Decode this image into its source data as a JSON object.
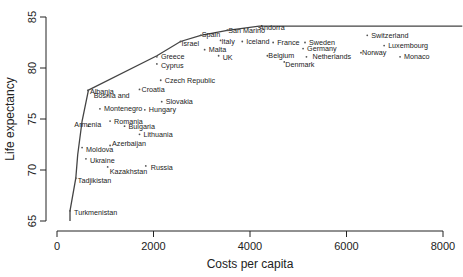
{
  "chart_data": {
    "type": "scatter",
    "title": "",
    "xlabel": "Costs per capita",
    "ylabel": "Life expectancy",
    "xlim": [
      0,
      8400
    ],
    "ylim": [
      65,
      85
    ],
    "x_ticks": [
      0,
      2000,
      4000,
      6000,
      8000
    ],
    "y_ticks": [
      65,
      70,
      75,
      80,
      85
    ],
    "x_tick_labels": [
      "0",
      "2000",
      "4000",
      "6000",
      "8000"
    ],
    "y_tick_labels": [
      "65",
      "70",
      "75",
      "80",
      "85"
    ],
    "grid": false,
    "legend": null,
    "points": [
      {
        "label": "Turkmenistan",
        "x": 270,
        "y": 66.0,
        "dx": 4,
        "dy": 2
      },
      {
        "label": "Tadjikistan",
        "x": 390,
        "y": 69.2,
        "dx": 2,
        "dy": 2
      },
      {
        "label": "Moldova",
        "x": 520,
        "y": 72.2,
        "dx": 4,
        "dy": 2
      },
      {
        "label": "Ukraine",
        "x": 600,
        "y": 71.1,
        "dx": 4,
        "dy": 2
      },
      {
        "label": "Kazakhstan",
        "x": 1050,
        "y": 70.3,
        "dx": 2,
        "dy": 5
      },
      {
        "label": "Russia",
        "x": 1840,
        "y": 70.4,
        "dx": 5,
        "dy": 2
      },
      {
        "label": "Azerbaijan",
        "x": 1100,
        "y": 72.4,
        "dx": 2,
        "dy": -2
      },
      {
        "label": "Armenia",
        "x": 650,
        "y": 74.3,
        "dx": -14,
        "dy": -2
      },
      {
        "label": "Romania",
        "x": 1100,
        "y": 74.8,
        "dx": 4,
        "dy": 0
      },
      {
        "label": "Bulgaria",
        "x": 1400,
        "y": 74.3,
        "dx": 4,
        "dy": 0
      },
      {
        "label": "Lithuania",
        "x": 1710,
        "y": 73.5,
        "dx": 4,
        "dy": 0
      },
      {
        "label": "Montenegro",
        "x": 890,
        "y": 76.0,
        "dx": 4,
        "dy": 0
      },
      {
        "label": "Hungary",
        "x": 1820,
        "y": 75.9,
        "dx": 4,
        "dy": 0
      },
      {
        "label": "Bosnia and",
        "x": 1050,
        "y": 77.3,
        "dx": -14,
        "dy": 0
      },
      {
        "label": "Albania",
        "x": 640,
        "y": 77.8,
        "dx": 2,
        "dy": 1
      },
      {
        "label": "Croatia",
        "x": 1710,
        "y": 77.9,
        "dx": 2,
        "dy": 0
      },
      {
        "label": "Slovakia",
        "x": 2170,
        "y": 76.7,
        "dx": 4,
        "dy": 0
      },
      {
        "label": "Czech Republic",
        "x": 2150,
        "y": 78.8,
        "dx": 4,
        "dy": 0
      },
      {
        "label": "Greece",
        "x": 2070,
        "y": 81.1,
        "dx": 4,
        "dy": 0
      },
      {
        "label": "Cyprus",
        "x": 2070,
        "y": 80.4,
        "dx": 4,
        "dy": 2
      },
      {
        "label": "Israel",
        "x": 2560,
        "y": 82.6,
        "dx": 1,
        "dy": 2
      },
      {
        "label": "Spain",
        "x": 2980,
        "y": 83.2,
        "dx": 1,
        "dy": -1
      },
      {
        "label": "Malta",
        "x": 3060,
        "y": 81.8,
        "dx": 4,
        "dy": 0
      },
      {
        "label": "Italy",
        "x": 3390,
        "y": 82.7,
        "dx": 1,
        "dy": 1
      },
      {
        "label": "UK",
        "x": 3350,
        "y": 81.2,
        "dx": 4,
        "dy": 2
      },
      {
        "label": "San Marino",
        "x": 3530,
        "y": 83.7,
        "dx": 1,
        "dy": 0
      },
      {
        "label": "Iceland",
        "x": 3840,
        "y": 82.6,
        "dx": 4,
        "dy": 0
      },
      {
        "label": "Andorra",
        "x": 4190,
        "y": 84.0,
        "dx": 0,
        "dy": 0
      },
      {
        "label": "France",
        "x": 4480,
        "y": 82.5,
        "dx": 4,
        "dy": 0
      },
      {
        "label": "Belgium",
        "x": 4360,
        "y": 81.2,
        "dx": 1,
        "dy": 0
      },
      {
        "label": "Denmark",
        "x": 4710,
        "y": 80.6,
        "dx": 1,
        "dy": 3
      },
      {
        "label": "Sweden",
        "x": 5140,
        "y": 82.5,
        "dx": 4,
        "dy": 0
      },
      {
        "label": "Germany",
        "x": 5100,
        "y": 81.9,
        "dx": 4,
        "dy": 0
      },
      {
        "label": "Netherlands",
        "x": 5170,
        "y": 81.1,
        "dx": 6,
        "dy": 0
      },
      {
        "label": "Switzerland",
        "x": 6430,
        "y": 83.2,
        "dx": 4,
        "dy": 0
      },
      {
        "label": "Norway",
        "x": 6300,
        "y": 81.5,
        "dx": 1,
        "dy": 0
      },
      {
        "label": "Luxembourg",
        "x": 6780,
        "y": 82.2,
        "dx": 4,
        "dy": 0
      },
      {
        "label": "Monaco",
        "x": 7110,
        "y": 81.1,
        "dx": 4,
        "dy": 0
      }
    ],
    "frontier": {
      "type": "line",
      "name": "efficiency frontier",
      "x": [
        270,
        270,
        390,
        430,
        520,
        650,
        640,
        2070,
        2560,
        2980,
        3530,
        4190,
        8400
      ],
      "y": [
        65.0,
        66.0,
        69.2,
        71.5,
        74.8,
        77.8,
        77.8,
        81.2,
        82.6,
        83.2,
        83.7,
        84.1,
        84.1
      ]
    }
  },
  "colors": {
    "axis": "#222222",
    "line": "#444444",
    "marker": "#555555",
    "background": "#ffffff"
  }
}
